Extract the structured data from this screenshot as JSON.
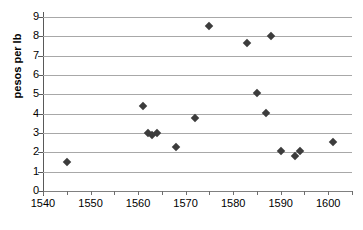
{
  "chart_data": {
    "type": "scatter",
    "title": "",
    "xlabel": "",
    "ylabel": "pesos per lb",
    "xlim": [
      1540,
      1605
    ],
    "ylim": [
      0,
      9
    ],
    "grid": true,
    "legend": "none",
    "marker": "diamond",
    "marker_color": "#3c3c3c",
    "gridline_color": "#a8a8a8",
    "xticks": [
      1540,
      1545,
      1550,
      1555,
      1560,
      1565,
      1570,
      1575,
      1580,
      1585,
      1590,
      1595,
      1600,
      1605
    ],
    "xtick_labels": [
      "1540",
      "",
      "1550",
      "",
      "1560",
      "",
      "1570",
      "",
      "1580",
      "",
      "1590",
      "",
      "1600",
      ""
    ],
    "yticks": [
      0,
      1,
      2,
      3,
      4,
      5,
      6,
      7,
      8,
      9
    ],
    "ytick_labels": [
      "0",
      "1",
      "2",
      "3",
      "4",
      "5",
      "6",
      "7",
      "8",
      "9"
    ],
    "points": [
      {
        "x": 1545,
        "y": 1.5
      },
      {
        "x": 1561,
        "y": 4.38
      },
      {
        "x": 1562,
        "y": 3.02
      },
      {
        "x": 1563,
        "y": 2.9
      },
      {
        "x": 1564,
        "y": 3.02
      },
      {
        "x": 1568,
        "y": 2.28
      },
      {
        "x": 1572,
        "y": 3.78
      },
      {
        "x": 1575,
        "y": 8.53
      },
      {
        "x": 1583,
        "y": 7.65
      },
      {
        "x": 1585,
        "y": 5.05
      },
      {
        "x": 1587,
        "y": 4.03
      },
      {
        "x": 1588,
        "y": 8.02
      },
      {
        "x": 1590,
        "y": 2.05
      },
      {
        "x": 1593,
        "y": 1.8
      },
      {
        "x": 1594,
        "y": 2.05
      },
      {
        "x": 1601,
        "y": 2.55
      }
    ]
  }
}
